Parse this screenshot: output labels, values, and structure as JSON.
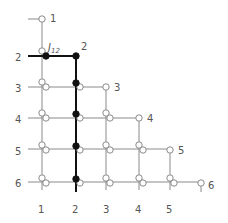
{
  "diagram": {
    "type": "lower-triangular grid of nodes",
    "row_labels": [
      "1",
      "2",
      "3",
      "4",
      "5",
      "6"
    ],
    "column_labels": [
      "1",
      "2",
      "3",
      "4",
      "5"
    ],
    "diagonal_labels": [
      "1",
      "2",
      "3",
      "4",
      "5",
      "6"
    ],
    "annotation": {
      "symbol": "J",
      "subscript": "12"
    },
    "highlighted_path": "row 2 from column 1 to column 2, then down column 2 through rows 3-6",
    "colors": {
      "line": "#8a8a8a",
      "highlight": "#111111",
      "text": "#555555"
    }
  }
}
